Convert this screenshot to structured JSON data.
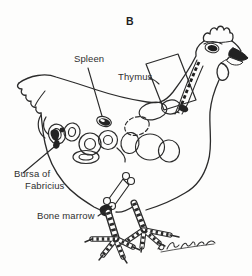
{
  "panel": {
    "label": "B"
  },
  "labels": {
    "spleen": "Spleen",
    "thymus": "Thymus",
    "bursa_line1": "Bursa of",
    "bursa_line2": "Fabricius",
    "bone_marrow": "Bone marrow"
  },
  "figure": {
    "signature_icon": "handwritten-artist-signature"
  },
  "colors": {
    "ink": "#2b2b2b",
    "fill_dark": "#242424",
    "background": "#fdfdfc",
    "text": "#2f2f2f"
  }
}
